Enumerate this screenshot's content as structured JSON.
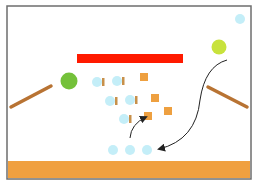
{
  "scene": {
    "frame": {
      "x": 7,
      "y": 6,
      "w": 244,
      "h": 173,
      "stroke": "#6e6e6e",
      "fill": "#ffffff"
    },
    "ground": {
      "x": 8,
      "y": 161,
      "w": 242,
      "h": 17,
      "color": "#f0a040"
    },
    "red_bar": {
      "x": 77,
      "y": 54,
      "w": 106,
      "h": 9,
      "color": "#ff1a00"
    },
    "balls": [
      {
        "name": "green-ball",
        "cx": 69,
        "cy": 81,
        "r": 8.5,
        "color": "#74c13a"
      },
      {
        "name": "yellow-green-ball",
        "cx": 219,
        "cy": 47,
        "r": 7.5,
        "color": "#c8e23c"
      },
      {
        "name": "light-blue-small-ball",
        "cx": 240,
        "cy": 19,
        "r": 5,
        "color": "#c4eef8"
      }
    ],
    "planks": [
      {
        "name": "left-plank",
        "x1": 11,
        "y1": 107,
        "x2": 51,
        "y2": 86,
        "width": 3.5,
        "color": "#b87333"
      },
      {
        "name": "right-plank",
        "x1": 208,
        "y1": 87,
        "x2": 247,
        "y2": 107,
        "width": 3.5,
        "color": "#b87333"
      }
    ],
    "cluster_balls": [
      {
        "cx": 97,
        "cy": 82,
        "r": 5
      },
      {
        "cx": 117,
        "cy": 81,
        "r": 5
      },
      {
        "cx": 110,
        "cy": 101,
        "r": 5
      },
      {
        "cx": 130,
        "cy": 100,
        "r": 5
      },
      {
        "cx": 124,
        "cy": 119,
        "r": 5
      }
    ],
    "cluster_ball_color": "#c4eef8",
    "cluster_tabs": [
      {
        "x": 102,
        "y": 78,
        "w": 2.5,
        "h": 8
      },
      {
        "x": 122,
        "y": 77,
        "w": 2.5,
        "h": 8
      },
      {
        "x": 115,
        "y": 97,
        "w": 2.5,
        "h": 8
      },
      {
        "x": 135,
        "y": 96,
        "w": 2.5,
        "h": 8
      },
      {
        "x": 129,
        "y": 115,
        "w": 2.5,
        "h": 8
      }
    ],
    "cluster_tab_color": "#c8904a",
    "squares": [
      {
        "x": 140,
        "y": 73,
        "s": 8
      },
      {
        "x": 151,
        "y": 94,
        "s": 8
      },
      {
        "x": 144,
        "y": 112,
        "s": 8
      },
      {
        "x": 164,
        "y": 107,
        "s": 8
      }
    ],
    "square_color": "#eea040",
    "target_balls": [
      {
        "cx": 113,
        "cy": 150,
        "r": 5
      },
      {
        "cx": 130,
        "cy": 150,
        "r": 5
      },
      {
        "cx": 147,
        "cy": 150,
        "r": 5
      }
    ],
    "target_ball_color": "#c4eef8",
    "arrows": [
      {
        "name": "arrow-up-to-square",
        "d": "M 130 138 Q 131 124 146 117",
        "color": "#222222"
      },
      {
        "name": "arrow-down-to-balls",
        "d": "M 227 60 Q 205 66 200 100 Q 196 140 159 149",
        "color": "#222222"
      }
    ]
  }
}
